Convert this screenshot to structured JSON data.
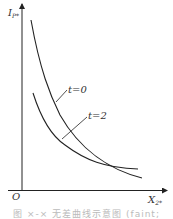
{
  "figure": {
    "y_axis_label": "I",
    "y_axis_sub": "P*",
    "x_axis_label": "X",
    "x_axis_sub": "2*",
    "origin_label": "O",
    "curve_labels": [
      "t=0",
      "t=2"
    ],
    "caption": "图 ×-× 无差曲线示意图 (faint; partly illegible)"
  },
  "colors": {
    "line": "#222222",
    "text": "#333333",
    "caption": "#bbbbbb"
  }
}
